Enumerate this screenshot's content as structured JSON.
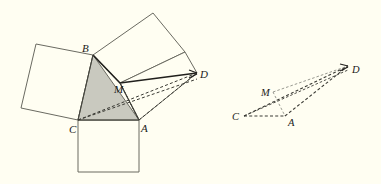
{
  "figure": {
    "background_color": "#fffef2",
    "stroke_color": "#5a5a52",
    "heavy_stroke_color": "#201f1c",
    "dashed_stroke_color": "#3a3a34",
    "shaded_fill": "#c9c9bf",
    "square_fill": "#fffef2"
  },
  "left_figure": {
    "name": "main-construction",
    "labels": [
      {
        "id": "B",
        "text": "B",
        "x": 82,
        "y": 52
      },
      {
        "id": "C",
        "text": "C",
        "x": 69,
        "y": 133
      },
      {
        "id": "A",
        "text": "A",
        "x": 141,
        "y": 132
      },
      {
        "id": "M",
        "text": "M",
        "x": 114,
        "y": 93
      },
      {
        "id": "D",
        "text": "D",
        "x": 200,
        "y": 78
      }
    ],
    "points": {
      "A": [
        139,
        120
      ],
      "B": [
        93,
        55
      ],
      "C": [
        78,
        120
      ],
      "M": [
        120,
        83
      ],
      "D": [
        197,
        73
      ]
    },
    "square_on_cb": {
      "name": "square-left",
      "points": "78,120 93,55 36,44 21,108"
    },
    "square_on_ca": {
      "name": "square-bottom",
      "points": "78,120 139,120 139,172 78,172"
    },
    "square_on_ba_upper": {
      "name": "square-upper-rotated",
      "points": "93,55 153,13 185,52 120,83"
    },
    "square_on_ba_lower": {
      "name": "square-lower-rotated",
      "points": "120,83 185,52 197,73 139,120"
    },
    "shaded_triangle": {
      "name": "shaded-triangle-bca",
      "points": "93,55 139,120 78,120"
    },
    "solid_segments": [
      {
        "name": "segment-b-to-m",
        "x1": 93,
        "y1": 55,
        "x2": 120,
        "y2": 83
      },
      {
        "name": "segment-m-to-d",
        "x1": 120,
        "y1": 83,
        "x2": 197,
        "y2": 73
      },
      {
        "name": "segment-c-to-b",
        "x1": 78,
        "y1": 120,
        "x2": 93,
        "y2": 55
      },
      {
        "name": "segment-c-to-a",
        "x1": 78,
        "y1": 120,
        "x2": 139,
        "y2": 120
      },
      {
        "name": "segment-a-to-m",
        "x1": 139,
        "y1": 120,
        "x2": 120,
        "y2": 83
      }
    ],
    "dashed_segments": [
      {
        "name": "dashed-c-to-d",
        "x1": 78,
        "y1": 120,
        "x2": 197,
        "y2": 73
      },
      {
        "name": "dashed-c-to-m-extended",
        "x1": 78,
        "y1": 120,
        "x2": 197,
        "y2": 78
      },
      {
        "name": "dashed-a-to-d",
        "x1": 139,
        "y1": 120,
        "x2": 197,
        "y2": 73
      },
      {
        "name": "dashed-m-to-a",
        "x1": 120,
        "y1": 83,
        "x2": 139,
        "y2": 120
      }
    ]
  },
  "right_figure": {
    "name": "companion-quadrilateral",
    "labels": [
      {
        "id": "C",
        "text": "C",
        "x": 232,
        "y": 120
      },
      {
        "id": "M",
        "text": "M",
        "x": 261,
        "y": 96
      },
      {
        "id": "A",
        "text": "A",
        "x": 288,
        "y": 126
      },
      {
        "id": "D",
        "text": "D",
        "x": 352,
        "y": 73
      }
    ],
    "points": {
      "C": [
        244,
        116
      ],
      "M": [
        273,
        92
      ],
      "A": [
        285,
        116
      ],
      "D": [
        348,
        66
      ]
    },
    "dashed_segments": [
      {
        "name": "dashed-c-to-a",
        "x1": 244,
        "y1": 116,
        "x2": 285,
        "y2": 116
      },
      {
        "name": "dashed-c-to-d",
        "x1": 244,
        "y1": 116,
        "x2": 348,
        "y2": 66
      },
      {
        "name": "dashed-a-to-d",
        "x1": 285,
        "y1": 116,
        "x2": 348,
        "y2": 66
      },
      {
        "name": "dashed-m-to-d",
        "x1": 273,
        "y1": 92,
        "x2": 348,
        "y2": 66
      },
      {
        "name": "dashed-m-to-a",
        "x1": 273,
        "y1": 92,
        "x2": 285,
        "y2": 116
      },
      {
        "name": "dashed-c-to-m",
        "x1": 244,
        "y1": 116,
        "x2": 273,
        "y2": 92
      }
    ]
  }
}
